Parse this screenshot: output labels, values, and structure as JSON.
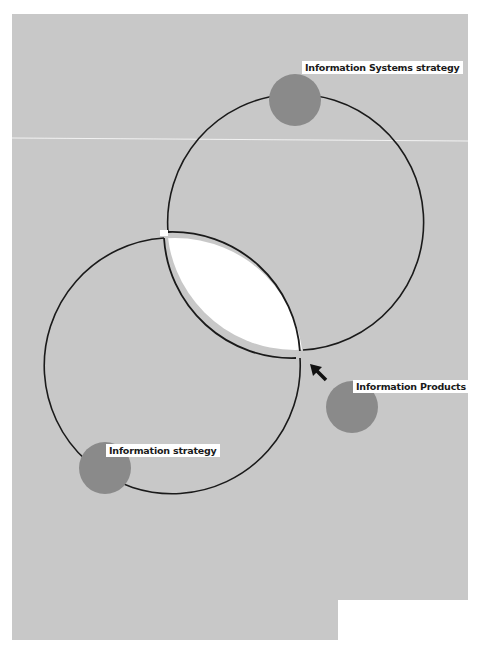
{
  "diagram": {
    "type": "overlapping-circles",
    "background_color": "#c8c8c8",
    "dot_color": "#8a8a8a",
    "circles": [
      {
        "name": "information-systems-strategy-circle",
        "label": "Information Systems strategy"
      },
      {
        "name": "information-strategy-circle",
        "label": "Information strategy"
      }
    ],
    "intersection": {
      "fill": "#ffffff"
    },
    "nodes": [
      {
        "id": "is-strategy",
        "label": "Information Systems strategy"
      },
      {
        "id": "info-products",
        "label": "Information Products"
      },
      {
        "id": "info-strategy",
        "label": "Information strategy"
      }
    ],
    "arrow": {
      "from": "info-products",
      "to": "intersection"
    }
  }
}
